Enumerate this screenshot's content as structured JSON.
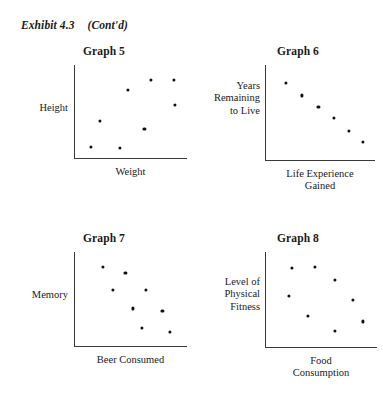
{
  "exhibit": {
    "label": "Exhibit 4.3",
    "continued": "(Cont'd)"
  },
  "chart_data": [
    {
      "type": "scatter",
      "title": "Graph 5",
      "xlabel": "Weight",
      "ylabel": "Height",
      "grid": false,
      "legend": null,
      "xlim": [
        0,
        100
      ],
      "ylim": [
        0,
        100
      ],
      "relationship": "no correlation",
      "points": [
        {
          "x": 14,
          "y": 12
        },
        {
          "x": 40,
          "y": 11
        },
        {
          "x": 22,
          "y": 40
        },
        {
          "x": 47,
          "y": 73
        },
        {
          "x": 68,
          "y": 84
        },
        {
          "x": 62,
          "y": 31
        },
        {
          "x": 88,
          "y": 84
        },
        {
          "x": 89,
          "y": 57
        }
      ]
    },
    {
      "type": "scatter",
      "title": "Graph 6",
      "xlabel": "Life Experience\nGained",
      "ylabel": "Years\nRemaining\nto Live",
      "grid": false,
      "legend": null,
      "xlim": [
        0,
        100
      ],
      "ylim": [
        0,
        100
      ],
      "relationship": "strong negative correlation",
      "points": [
        {
          "x": 18,
          "y": 81
        },
        {
          "x": 33,
          "y": 68
        },
        {
          "x": 48,
          "y": 56
        },
        {
          "x": 62,
          "y": 44
        },
        {
          "x": 76,
          "y": 31
        },
        {
          "x": 89,
          "y": 19
        }
      ]
    },
    {
      "type": "scatter",
      "title": "Graph 7",
      "xlabel": "Beer Consumed",
      "ylabel": "Memory",
      "grid": false,
      "legend": null,
      "xlim": [
        0,
        100
      ],
      "ylim": [
        0,
        100
      ],
      "relationship": "moderate negative correlation",
      "points": [
        {
          "x": 25,
          "y": 84
        },
        {
          "x": 45,
          "y": 78
        },
        {
          "x": 34,
          "y": 60
        },
        {
          "x": 63,
          "y": 60
        },
        {
          "x": 52,
          "y": 40
        },
        {
          "x": 78,
          "y": 37
        },
        {
          "x": 60,
          "y": 19
        },
        {
          "x": 85,
          "y": 15
        }
      ]
    },
    {
      "type": "scatter",
      "title": "Graph 8",
      "xlabel": "Food\nConsumption",
      "ylabel": "Level of\nPhysical\nFitness",
      "grid": false,
      "legend": null,
      "xlim": [
        0,
        100
      ],
      "ylim": [
        0,
        100
      ],
      "relationship": "curvilinear / inverted-U",
      "points": [
        {
          "x": 23,
          "y": 83
        },
        {
          "x": 44,
          "y": 84
        },
        {
          "x": 62,
          "y": 71
        },
        {
          "x": 21,
          "y": 54
        },
        {
          "x": 78,
          "y": 50
        },
        {
          "x": 38,
          "y": 33
        },
        {
          "x": 87,
          "y": 27
        },
        {
          "x": 62,
          "y": 17
        }
      ]
    }
  ]
}
